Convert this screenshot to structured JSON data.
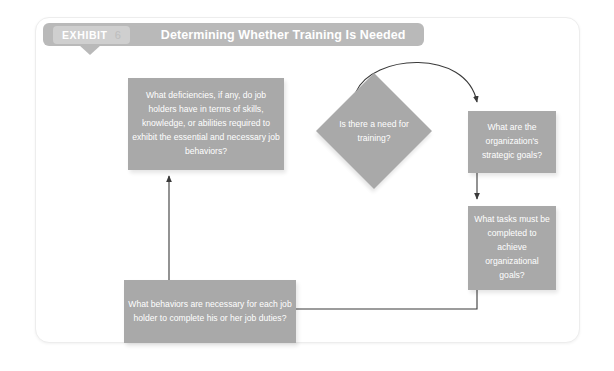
{
  "exhibit": {
    "label": "EXHIBIT",
    "number": "6",
    "title": "Determining Whether Training Is Needed"
  },
  "colors": {
    "header_bar": "#b9b9b9",
    "exhibit_tag": "#cfcfcf",
    "node_fill": "#a9a9a9",
    "node_text": "#ffffff",
    "connector": "#3a3a3a",
    "panel_border": "#ededed",
    "page_background": "#ffffff"
  },
  "flowchart": {
    "type": "process-flow-diagram",
    "nodes": [
      {
        "id": "decision",
        "shape": "diamond",
        "text": "Is there a need\nfor training?"
      },
      {
        "id": "org-goals",
        "shape": "rectangle",
        "text": "What are the organization's strategic goals?"
      },
      {
        "id": "tasks",
        "shape": "rectangle",
        "text": "What tasks must be completed to achieve organizational goals?"
      },
      {
        "id": "behaviors",
        "shape": "rectangle",
        "text": "What behaviors are necessary for each job holder to complete his or her job duties?"
      },
      {
        "id": "deficiencies",
        "shape": "rectangle",
        "text": "What deficiencies, if any, do job holders have in terms of skills, knowledge, or abilities required to exhibit the essential and necessary job behaviors?"
      }
    ],
    "edges": [
      {
        "from": "decision",
        "to": "org-goals",
        "style": "curved-arc"
      },
      {
        "from": "org-goals",
        "to": "tasks",
        "style": "straight-vertical"
      },
      {
        "from": "tasks",
        "to": "behaviors",
        "style": "elbow-horizontal"
      },
      {
        "from": "behaviors",
        "to": "deficiencies",
        "style": "straight-vertical"
      }
    ]
  }
}
